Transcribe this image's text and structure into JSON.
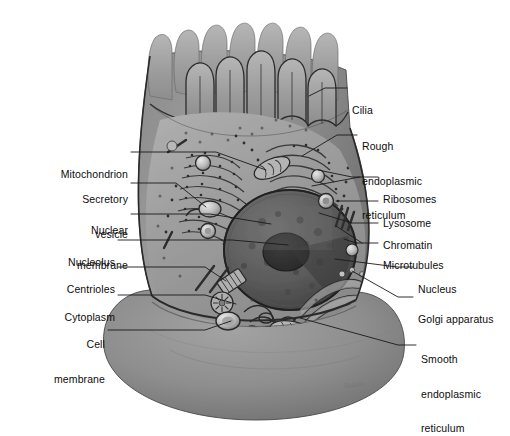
{
  "figure": {
    "signature": "Tedeva",
    "background_color": "#ffffff",
    "label_color": "#0d0d0d",
    "leader_color": "#1a1a1a",
    "cell_body_color": "#8d8d8d",
    "cytoplasm_color": "#9a9a9a",
    "nucleus_color": "#5e5e5e",
    "membrane_outline_color": "#2b2b2b"
  },
  "labels": [
    {
      "id": "cilia",
      "text": "Cilia",
      "side": "right",
      "x": 352,
      "y": 88,
      "lines": [
        "Cilia"
      ]
    },
    {
      "id": "rough-er",
      "text": "Rough endoplasmic reticulum",
      "side": "right",
      "x": 362,
      "y": 118,
      "lines": [
        "Rough",
        "endoplasmic",
        "reticulum"
      ]
    },
    {
      "id": "ribosomes",
      "text": "Ribosomes",
      "side": "right",
      "x": 383,
      "y": 172,
      "lines": [
        "Ribosomes"
      ]
    },
    {
      "id": "lysosome",
      "text": "Lysosome",
      "side": "right",
      "x": 383,
      "y": 197,
      "lines": [
        "Lysosome"
      ]
    },
    {
      "id": "chromatin",
      "text": "Chromatin",
      "side": "right",
      "x": 383,
      "y": 219,
      "lines": [
        "Chromatin"
      ]
    },
    {
      "id": "microtubules",
      "text": "Microtubules",
      "side": "right",
      "x": 383,
      "y": 239,
      "lines": [
        "Microtubules"
      ]
    },
    {
      "id": "nucleus",
      "text": "Nucleus",
      "side": "right",
      "x": 418,
      "y": 263,
      "lines": [
        "Nucleus"
      ]
    },
    {
      "id": "golgi",
      "text": "Golgi apparatus",
      "side": "right",
      "x": 418,
      "y": 293,
      "lines": [
        "Golgi apparatus"
      ]
    },
    {
      "id": "smooth-er",
      "text": "Smooth endoplasmic reticulum",
      "side": "right",
      "x": 421,
      "y": 333,
      "lines": [
        "Smooth",
        "endoplasmic",
        "reticulum"
      ]
    },
    {
      "id": "mitochondrion",
      "text": "Mitochondrion",
      "side": "left",
      "x": 126,
      "y": 148,
      "lines": [
        "Mitochondrion"
      ]
    },
    {
      "id": "secretory-vesicle",
      "text": "Secretory vesicle",
      "side": "left",
      "x": 126,
      "y": 174,
      "lines": [
        "Secretory",
        "vesicle"
      ]
    },
    {
      "id": "nuclear-membrane",
      "text": "Nuclear membrane",
      "side": "left",
      "x": 126,
      "y": 205,
      "lines": [
        "Nuclear",
        "membrane"
      ]
    },
    {
      "id": "nucleolus",
      "text": "Nucleolus",
      "side": "left",
      "x": 113,
      "y": 236,
      "lines": [
        "Nucleolus"
      ]
    },
    {
      "id": "centrioles",
      "text": "Centrioles",
      "side": "left",
      "x": 113,
      "y": 263,
      "lines": [
        "Centrioles"
      ]
    },
    {
      "id": "cytoplasm",
      "text": "Cytoplasm",
      "side": "left",
      "x": 113,
      "y": 291,
      "lines": [
        "Cytoplasm"
      ]
    },
    {
      "id": "cell-membrane",
      "text": "Cell membrane",
      "side": "left",
      "x": 103,
      "y": 318,
      "lines": [
        "Cell",
        "membrane"
      ]
    }
  ],
  "leaders": [
    {
      "id": "cilia",
      "d": "M347,88 L325,88 L309,96"
    },
    {
      "id": "rough-er",
      "d": "M357,135 L337,135 L302,156"
    },
    {
      "id": "ribosomes",
      "d": "M378,177 L352,177 L318,170"
    },
    {
      "id": "ribosomes-b",
      "d": "M378,177 L352,177 L312,186"
    },
    {
      "id": "lysosome",
      "d": "M378,201 L336,201 L324,201"
    },
    {
      "id": "chromatin",
      "d": "M378,223 L350,223 L319,213"
    },
    {
      "id": "microtubules",
      "d": "M378,243 L356,243 L344,239"
    },
    {
      "id": "microtubules-b",
      "d": "M378,243 L356,243 L336,226"
    },
    {
      "id": "nucleus",
      "d": "M413,267 L397,267 L335,259"
    },
    {
      "id": "golgi",
      "d": "M413,297 L398,297 L352,271"
    },
    {
      "id": "smooth-er",
      "d": "M416,345 L398,345 L300,318"
    },
    {
      "id": "mitochondrion",
      "d": "M131,152 L216,152 L266,170"
    },
    {
      "id": "secretory-vesicle",
      "d": "M131,183 L176,183 L206,207"
    },
    {
      "id": "nuclear-membrane",
      "d": "M131,214 L210,214 L271,224"
    },
    {
      "id": "nucleolus",
      "d": "M118,240 L232,240 L288,245"
    },
    {
      "id": "centrioles",
      "d": "M118,267 L205,267 L226,281"
    },
    {
      "id": "cytoplasm",
      "d": "M118,295 L205,295 L236,304"
    },
    {
      "id": "cell-membrane",
      "d": "M108,330 L205,330 L231,321"
    }
  ]
}
